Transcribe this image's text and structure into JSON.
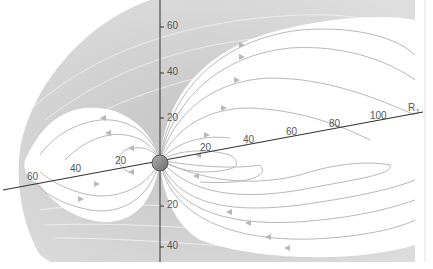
{
  "diagram": {
    "unit_label": "R",
    "unit_subscript": "J",
    "vertical_axis_ticks": [
      {
        "label": "60",
        "y": 27
      },
      {
        "label": "40",
        "y": 73
      },
      {
        "label": "20",
        "y": 118
      },
      {
        "label": "20",
        "y": 206
      },
      {
        "label": "40",
        "y": 247
      }
    ],
    "tilted_axis_ticks_left": [
      {
        "label": "60",
        "x": 30,
        "y": 180
      },
      {
        "label": "40",
        "x": 73,
        "y": 172
      },
      {
        "label": "20",
        "x": 118,
        "y": 164
      }
    ],
    "tilted_axis_ticks_right": [
      {
        "label": "20",
        "x": 204,
        "y": 150
      },
      {
        "label": "40",
        "x": 248,
        "y": 142
      },
      {
        "label": "60",
        "x": 290,
        "y": 134
      },
      {
        "label": "80",
        "x": 333,
        "y": 126
      },
      {
        "label": "100",
        "x": 376,
        "y": 118
      }
    ],
    "colors": {
      "outer_region": "#cfcfcf",
      "inner_region": "#ffffff",
      "field_line": "#b5b5b5",
      "outer_field_line": "#e8e8e8",
      "axis": "#333333",
      "planet": "#8c8c8c"
    }
  }
}
